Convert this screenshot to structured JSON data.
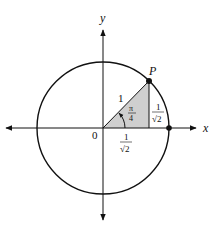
{
  "diagram": {
    "axes": {
      "x_label": "x",
      "y_label": "y",
      "origin_label": "0"
    },
    "point": {
      "label": "P",
      "angle": "π/4"
    },
    "hypotenuse_label": "1",
    "angle_label": {
      "numerator": "π",
      "denominator": "4"
    },
    "vertical_leg_label": {
      "numerator": "1",
      "denominator": "√2"
    },
    "horizontal_leg_label": {
      "numerator": "1",
      "denominator": "√2"
    },
    "colors": {
      "stroke": "#111111",
      "triangle_fill": "#cfcfcf",
      "background": "#ffffff"
    }
  }
}
